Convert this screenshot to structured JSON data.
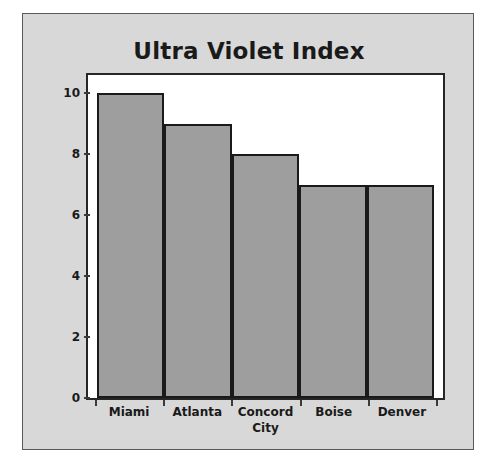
{
  "chart_data": {
    "type": "bar",
    "title": "Ultra Violet Index",
    "xlabel": "City",
    "ylabel": "Index",
    "categories": [
      "Miami",
      "Atlanta",
      "Concord",
      "Boise",
      "Denver"
    ],
    "values": [
      10,
      9,
      8,
      7,
      7
    ],
    "ylim": [
      0,
      10.6
    ],
    "yticks": [
      0,
      2,
      4,
      6,
      8,
      10
    ],
    "ytick_labels": [
      "0",
      "2",
      "4",
      "6",
      "8",
      "10"
    ],
    "grid": false,
    "legend": null,
    "series": [
      {
        "name": "Ultra Violet Index",
        "values": [
          10,
          9,
          8,
          7,
          7
        ]
      }
    ]
  },
  "style": {
    "figure_background": "#d8d8d8",
    "plot_background": "#ffffff",
    "bar_fill": "#9e9e9e",
    "bar_edge": "#1a1a1a",
    "text_color": "#1a1a1a",
    "axis_color": "#262626"
  }
}
